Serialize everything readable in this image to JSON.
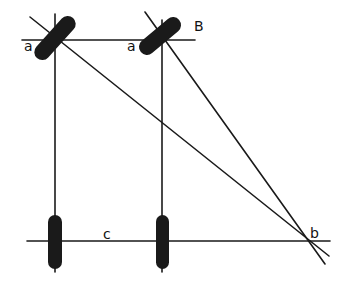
{
  "diagram": {
    "title": "",
    "colors": {
      "ink": "#1a1a1a",
      "background": "#ffffff"
    },
    "labels": {
      "a_left": "a",
      "a_right": "a",
      "B": "B",
      "c": "c",
      "b": "b"
    },
    "elements": {
      "top_line": "horizontal line through upper tilted objects",
      "bottom_line": "horizontal line c through lower upright objects",
      "left_vertical": "vertical line connecting left top and bottom objects",
      "right_vertical": "vertical line connecting right top and bottom objects",
      "diagonal_1": "line from left upper object to point b",
      "diagonal_2": "line from right upper object B to point b",
      "upper_objects": [
        "tilted capsule at left a",
        "tilted capsule at right a (B)"
      ],
      "lower_objects": [
        "upright capsule left",
        "upright capsule right"
      ]
    }
  }
}
